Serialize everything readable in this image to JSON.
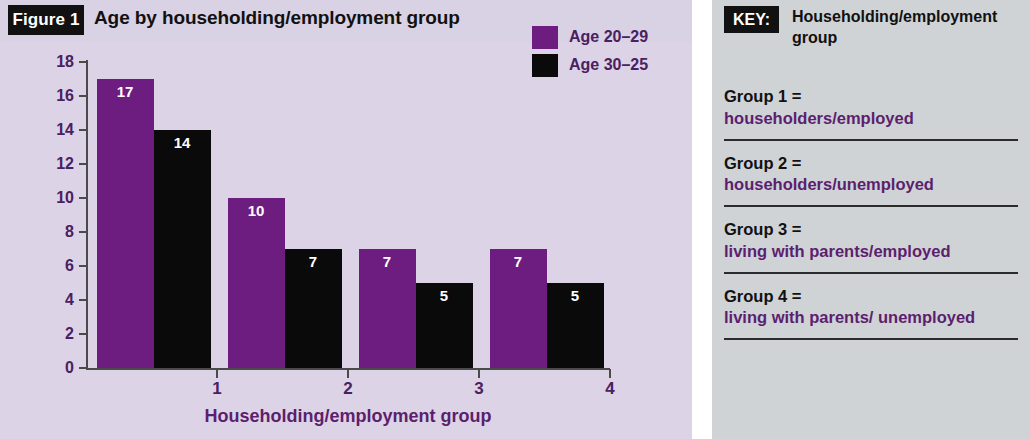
{
  "figure": {
    "badge": "Figure 1",
    "title": "Age by householding/employment group"
  },
  "colors": {
    "series_1": "#6d1d80",
    "series_2": "#0a0a0a",
    "chart_background": "#dcd3e6",
    "key_background": "#cfd3d6",
    "axis_text": "#4a2060",
    "key_desc_text": "#5c1f6e"
  },
  "legend": {
    "items": [
      {
        "label": "Age 20–29",
        "swatch": "purple"
      },
      {
        "label": "Age 30–25",
        "swatch": "black"
      }
    ]
  },
  "axes": {
    "y_ticks": [
      "18",
      "16",
      "14",
      "12",
      "10",
      "8",
      "6",
      "4",
      "2",
      "0"
    ],
    "x_ticks": [
      "1",
      "2",
      "3",
      "4"
    ],
    "x_title": "Householding/employment group"
  },
  "key": {
    "badge": "KEY:",
    "heading": "Householding/employment group",
    "items": [
      {
        "label": "Group 1 =",
        "desc": "householders/employed"
      },
      {
        "label": "Group 2 =",
        "desc": "householders/unemployed"
      },
      {
        "label": "Group 3 =",
        "desc": "living with parents/employed"
      },
      {
        "label": "Group 4 =",
        "desc": "living with parents/ unemployed"
      }
    ]
  },
  "chart_data": {
    "type": "bar",
    "title": "Age by householding/employment group",
    "xlabel": "Householding/employment group",
    "ylabel": "",
    "categories": [
      "1",
      "2",
      "3",
      "4"
    ],
    "ylim": [
      0,
      18
    ],
    "y_tick_step": 2,
    "grid": false,
    "legend_position": "top-right",
    "series": [
      {
        "name": "Age 20–29",
        "color": "#6d1d80",
        "values": [
          17,
          10,
          7,
          7
        ]
      },
      {
        "name": "Age 30–25",
        "color": "#0a0a0a",
        "values": [
          14,
          7,
          5,
          5
        ]
      }
    ]
  }
}
